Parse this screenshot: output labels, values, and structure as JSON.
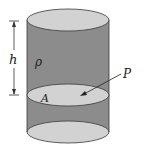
{
  "diagram": {
    "type": "fluid-column-cylinder",
    "labels": {
      "height": "h",
      "density": "ρ",
      "area": "A",
      "pressure": "P"
    },
    "colors": {
      "background": "#ffffff",
      "cylinder_body": "#8c8c8c",
      "ellipse_fill": "#d2d2d2",
      "outline": "#3a3a3a",
      "text": "#222222"
    }
  }
}
